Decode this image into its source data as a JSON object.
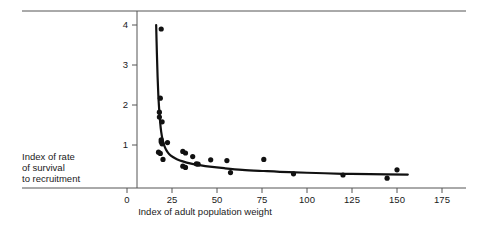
{
  "chart_data": {
    "type": "scatter",
    "title": "",
    "subtitle": "",
    "xlabel": "Index of adult population weight",
    "ylabel": "Index of rate of survival to recruitment",
    "ylabel_lines": [
      "Index of rate",
      "of survival",
      "to recruitment"
    ],
    "xlim": [
      0,
      175
    ],
    "ylim": [
      0,
      4.3
    ],
    "xticks": [
      0,
      25,
      50,
      75,
      100,
      125,
      150,
      175
    ],
    "xtick_labels": [
      "0",
      "25",
      "50",
      "75",
      "100",
      "125",
      "150",
      "175"
    ],
    "yticks": [
      1,
      2,
      3,
      4
    ],
    "ytick_labels": [
      "1",
      "2",
      "3",
      "4"
    ],
    "grid": false,
    "legend": null,
    "marker_color": "#111111",
    "line_color": "#111111",
    "axis_color": "#4a4a4a",
    "points": [
      {
        "x": 19.0,
        "y": 3.9
      },
      {
        "x": 18.5,
        "y": 2.17
      },
      {
        "x": 18.0,
        "y": 1.82
      },
      {
        "x": 18.0,
        "y": 1.7
      },
      {
        "x": 19.5,
        "y": 1.58
      },
      {
        "x": 19.0,
        "y": 1.13
      },
      {
        "x": 19.0,
        "y": 1.08
      },
      {
        "x": 19.5,
        "y": 1.03
      },
      {
        "x": 22.5,
        "y": 1.06
      },
      {
        "x": 17.5,
        "y": 0.82
      },
      {
        "x": 18.5,
        "y": 0.79
      },
      {
        "x": 20.0,
        "y": 0.64
      },
      {
        "x": 31.0,
        "y": 0.84
      },
      {
        "x": 32.5,
        "y": 0.8
      },
      {
        "x": 36.5,
        "y": 0.71
      },
      {
        "x": 31.0,
        "y": 0.47
      },
      {
        "x": 32.5,
        "y": 0.44
      },
      {
        "x": 38.5,
        "y": 0.53
      },
      {
        "x": 39.5,
        "y": 0.52
      },
      {
        "x": 46.5,
        "y": 0.63
      },
      {
        "x": 55.5,
        "y": 0.61
      },
      {
        "x": 57.5,
        "y": 0.31
      },
      {
        "x": 76.0,
        "y": 0.64
      },
      {
        "x": 92.5,
        "y": 0.28
      },
      {
        "x": 120.0,
        "y": 0.25
      },
      {
        "x": 144.5,
        "y": 0.17
      },
      {
        "x": 150.0,
        "y": 0.38
      }
    ],
    "fit_curve": {
      "description": "hyperbolic decay fitted to scatter",
      "x_start": 16.2,
      "x_end": 156.0,
      "points": [
        {
          "x": 16.2,
          "y": 4.0
        },
        {
          "x": 16.6,
          "y": 3.3
        },
        {
          "x": 17.0,
          "y": 2.7
        },
        {
          "x": 17.4,
          "y": 2.25
        },
        {
          "x": 17.9,
          "y": 1.88
        },
        {
          "x": 18.4,
          "y": 1.58
        },
        {
          "x": 19.0,
          "y": 1.33
        },
        {
          "x": 19.8,
          "y": 1.13
        },
        {
          "x": 20.8,
          "y": 0.97
        },
        {
          "x": 22.0,
          "y": 0.86
        },
        {
          "x": 23.5,
          "y": 0.77
        },
        {
          "x": 25.5,
          "y": 0.7
        },
        {
          "x": 28.0,
          "y": 0.64
        },
        {
          "x": 31.0,
          "y": 0.59
        },
        {
          "x": 35.0,
          "y": 0.54
        },
        {
          "x": 40.0,
          "y": 0.5
        },
        {
          "x": 46.0,
          "y": 0.46
        },
        {
          "x": 54.0,
          "y": 0.42
        },
        {
          "x": 64.0,
          "y": 0.38
        },
        {
          "x": 76.0,
          "y": 0.35
        },
        {
          "x": 90.0,
          "y": 0.32
        },
        {
          "x": 105.0,
          "y": 0.3
        },
        {
          "x": 120.0,
          "y": 0.28
        },
        {
          "x": 135.0,
          "y": 0.27
        },
        {
          "x": 156.0,
          "y": 0.26
        }
      ]
    }
  },
  "figure": {
    "top_rule": true,
    "bottom_rule": true
  }
}
